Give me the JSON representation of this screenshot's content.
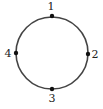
{
  "diagram": {
    "type": "cycle-graph",
    "circle": {
      "cx": 52,
      "cy": 53,
      "r": 36,
      "stroke": "#444444"
    },
    "nodes": [
      {
        "id": "1",
        "label": "1",
        "x": 52,
        "y": 16,
        "lx": 51,
        "ly": 10
      },
      {
        "id": "2",
        "label": "2",
        "x": 88,
        "y": 54,
        "lx": 95,
        "ly": 58
      },
      {
        "id": "3",
        "label": "3",
        "x": 52,
        "y": 89,
        "lx": 52,
        "ly": 102
      },
      {
        "id": "4",
        "label": "4",
        "x": 16,
        "y": 53,
        "lx": 8,
        "ly": 57
      }
    ]
  }
}
